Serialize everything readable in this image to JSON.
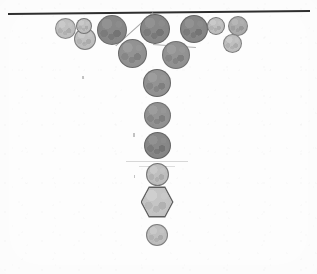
{
  "figure": {
    "background_color": "#fdfdfd",
    "width": 317,
    "height": 274
  },
  "boundary": {
    "name": "top wall",
    "color": "#2e2e2e",
    "x1": 8,
    "y1": 14,
    "x2": 310,
    "y2": 11,
    "thickness": 2.2
  },
  "contact_line": {
    "name": "thin contact line",
    "color": "#a6a6a6",
    "x1": 153,
    "y1": 13,
    "x2": 116,
    "y2": 46,
    "thickness": 1.1
  },
  "contact_line_2": {
    "name": "thin contact line lower",
    "color": "#b0b0b0",
    "x1": 153,
    "y1": 44,
    "x2": 196,
    "y2": 47,
    "thickness": 1.0
  },
  "smudges": [
    {
      "x": 126,
      "y": 161,
      "w": 62,
      "h": 1.4,
      "color": "#c9c9c9"
    },
    {
      "x": 139,
      "y": 166,
      "w": 36,
      "h": 1.0,
      "color": "#d2d2d2"
    }
  ],
  "specks": [
    {
      "x": 82,
      "y": 76,
      "w": 1.6,
      "h": 3.0
    },
    {
      "x": 133,
      "y": 133,
      "w": 1.6,
      "h": 4.0
    },
    {
      "x": 134,
      "y": 175,
      "w": 1.4,
      "h": 3.0
    }
  ],
  "palette": {
    "light_gray": "#b9b9b9",
    "mid_gray": "#a6a6a6",
    "dark_gray": "#8d8d8d",
    "darker_gray": "#828282",
    "outline": "#464646",
    "hex_fill": "#bfbfbf",
    "hex_outline": "#5d5d5d"
  },
  "chart_data": {
    "type": "scatter",
    "xlabel": "",
    "ylabel": "",
    "xlim": [
      0,
      317
    ],
    "ylim": [
      0,
      274
    ],
    "grid": false,
    "legend": null,
    "annotations": [
      "horizontal dark boundary line across top",
      "thin diagonal contact line from boundary down-left",
      "particles form an inverted-V / funnel arch tapering to a single vertical column",
      "one hexagonal particle near the bottom of the column"
    ],
    "series": [
      {
        "name": "particles",
        "shape_key": "shape",
        "fields": [
          "cx",
          "cy",
          "d",
          "shape",
          "tone"
        ],
        "values": [
          {
            "cx": 65,
            "cy": 28,
            "d": 21,
            "shape": "circle",
            "tone": "light_gray"
          },
          {
            "cx": 85,
            "cy": 39,
            "d": 22,
            "shape": "circle",
            "tone": "light_gray"
          },
          {
            "cx": 84,
            "cy": 26,
            "d": 16,
            "shape": "circle",
            "tone": "light_gray"
          },
          {
            "cx": 112,
            "cy": 30,
            "d": 30,
            "shape": "circle",
            "tone": "darker_gray"
          },
          {
            "cx": 132,
            "cy": 53,
            "d": 29,
            "shape": "circle",
            "tone": "dark_gray"
          },
          {
            "cx": 155,
            "cy": 29,
            "d": 30,
            "shape": "circle",
            "tone": "darker_gray"
          },
          {
            "cx": 176,
            "cy": 55,
            "d": 28,
            "shape": "circle",
            "tone": "dark_gray"
          },
          {
            "cx": 194,
            "cy": 29,
            "d": 28,
            "shape": "circle",
            "tone": "darker_gray"
          },
          {
            "cx": 216,
            "cy": 26,
            "d": 18,
            "shape": "circle",
            "tone": "light_gray"
          },
          {
            "cx": 238,
            "cy": 26,
            "d": 20,
            "shape": "circle",
            "tone": "mid_gray"
          },
          {
            "cx": 232,
            "cy": 43,
            "d": 19,
            "shape": "circle",
            "tone": "light_gray"
          },
          {
            "cx": 157,
            "cy": 83,
            "d": 28,
            "shape": "circle",
            "tone": "dark_gray"
          },
          {
            "cx": 157,
            "cy": 115,
            "d": 27,
            "shape": "circle",
            "tone": "dark_gray"
          },
          {
            "cx": 157,
            "cy": 145,
            "d": 27,
            "shape": "circle",
            "tone": "darker_gray"
          },
          {
            "cx": 157,
            "cy": 174,
            "d": 23,
            "shape": "circle",
            "tone": "light_gray"
          },
          {
            "cx": 157,
            "cy": 202,
            "d": 33,
            "shape": "hexagon",
            "tone": "hex_fill"
          },
          {
            "cx": 157,
            "cy": 235,
            "d": 22,
            "shape": "circle",
            "tone": "light_gray"
          }
        ]
      }
    ]
  }
}
